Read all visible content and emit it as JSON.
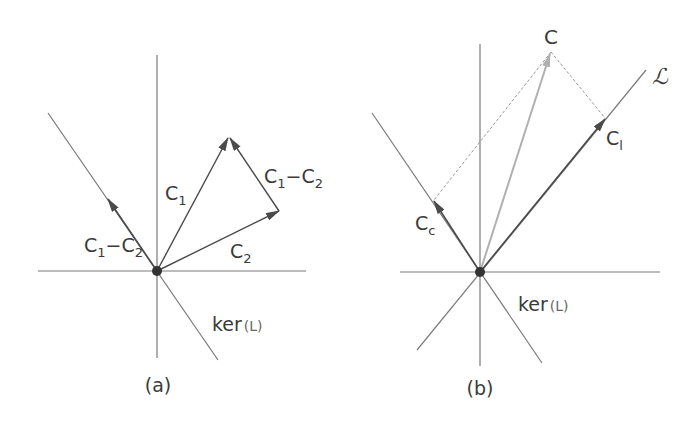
{
  "figure": {
    "panels": [
      {
        "id": "a",
        "caption": "(a)",
        "labels": {
          "c1": "C",
          "c1_sub": "1",
          "c2": "C",
          "c2_sub": "2",
          "diff_right_a": "C",
          "diff_right_a_sub": "1",
          "diff_right_op": "−C",
          "diff_right_b_sub": "2",
          "diff_left_a": "C",
          "diff_left_a_sub": "1",
          "diff_left_op": "−C",
          "diff_left_b_sub": "2",
          "ker": "ker",
          "ker_arg": "(L)"
        }
      },
      {
        "id": "b",
        "caption": "(b)",
        "labels": {
          "c": "C",
          "cl": "C",
          "cl_sub": "l",
          "cc": "C",
          "cc_sub": "c",
          "line_L": "ℒ",
          "ker": "ker",
          "ker_arg": "(L)"
        }
      }
    ],
    "colors": {
      "axis": "#7a7a7a",
      "vector": "#4a4a4a",
      "projection_vector": "#b0b0b0",
      "dashed": "#9a9a9a",
      "origin": "#333333",
      "text": "#3a3a3a"
    }
  }
}
